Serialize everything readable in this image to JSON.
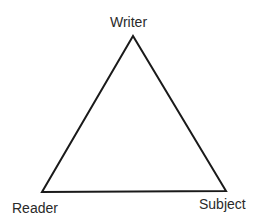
{
  "diagram": {
    "type": "triangle",
    "stroke_color": "#1a1a1a",
    "vertices": {
      "top": {
        "label": "Writer"
      },
      "bottom_left": {
        "label": "Reader"
      },
      "bottom_right": {
        "label": "Subject"
      }
    }
  }
}
